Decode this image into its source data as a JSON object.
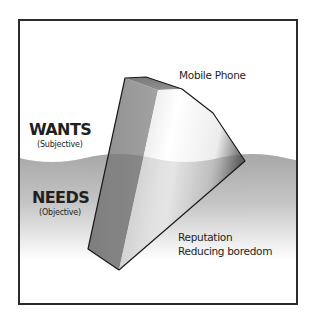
{
  "diagram": {
    "type": "iceberg",
    "upper_zone": {
      "title": "WANTS",
      "subtitle": "(Subjective)"
    },
    "lower_zone": {
      "title": "NEEDS",
      "subtitle": "(Objective)"
    },
    "above_water_label": "Mobile Phone",
    "below_water_labels": [
      "Reputation",
      "Reducing boredom"
    ],
    "colors": {
      "frame": "#2b2b2b",
      "water_top": "#a9a9a9",
      "water_bottom": "#ffffff",
      "text": "#231f20",
      "outline": "#1a1a1a"
    }
  }
}
